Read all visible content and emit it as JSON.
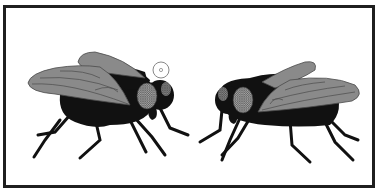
{
  "illustration": {
    "subject": "Two houseflies facing each other",
    "left_fly": {
      "facing": "right",
      "has_ring_marker": true
    },
    "right_fly": {
      "facing": "left",
      "has_ring_marker": false
    },
    "colors": {
      "frame": "#1f1f1f",
      "body": "#111111",
      "wing": "#8a8a8a",
      "wing_vein": "#4a4a4a",
      "eye": "#9a9a9a",
      "background": "#ffffff"
    }
  }
}
